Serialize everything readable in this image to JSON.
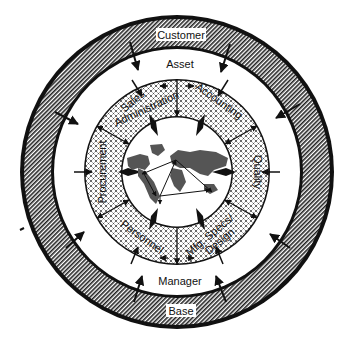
{
  "diagram": {
    "title": "",
    "center": {
      "label": "world-map",
      "description": "World map with network arrows linking continents"
    },
    "rings": {
      "outer": {
        "top_label": "Customer",
        "bottom_label": "Base",
        "fill": "diagonal-hatch"
      },
      "middle": {
        "top_label": "Asset",
        "bottom_label": "Manager",
        "fill": "white"
      },
      "inner": {
        "fill": "crosshatch-dots",
        "segments": [
          {
            "label": "Sales Administration",
            "line1": "Sales",
            "line2": "Administration"
          },
          {
            "label": "Accounting",
            "line1": "Accounting"
          },
          {
            "label": "Quality",
            "line1": "Quality"
          },
          {
            "label": "Mfg. Specs/ Design",
            "line1": "Mfg. Specs/",
            "line2": "Design"
          },
          {
            "label": "Personnel",
            "line1": "Personnel"
          },
          {
            "label": "Procurement",
            "line1": "Procurement"
          }
        ]
      }
    },
    "colors": {
      "ink": "#111111",
      "hatch": "#8a8a8a",
      "land": "#555555",
      "background": "#ffffff"
    }
  }
}
